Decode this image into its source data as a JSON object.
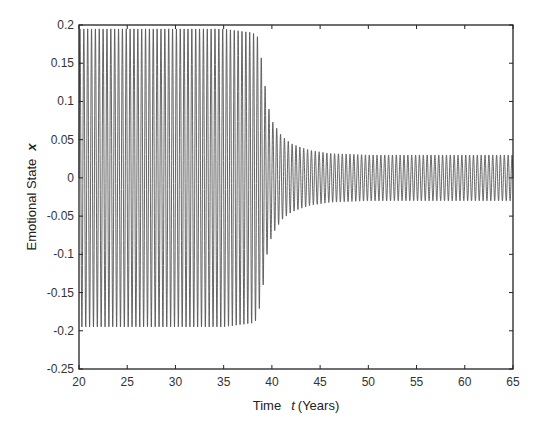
{
  "chart_data": {
    "type": "line",
    "title": "",
    "xlabel": "Time t (Years)",
    "xlabel_parts": {
      "prefix": "Time",
      "var": "t",
      "suffix": "(Years)"
    },
    "ylabel": "Emotional State x",
    "ylabel_parts": {
      "prefix": "Emotional State",
      "var": "x"
    },
    "xlim": [
      20,
      65
    ],
    "ylim": [
      -0.25,
      0.2
    ],
    "xticks": [
      20,
      25,
      30,
      35,
      40,
      45,
      50,
      55,
      60,
      65
    ],
    "yticks": [
      0.2,
      0.15,
      0.1,
      0.05,
      0,
      -0.05,
      -0.1,
      -0.15,
      -0.2,
      -0.25
    ],
    "ytick_labels": [
      "0.2",
      "0.15",
      "0.1",
      "0.05",
      "0",
      "-0.05",
      "-0.1",
      "-0.15",
      "-0.2",
      "-0.25"
    ],
    "grid": false,
    "legend": null,
    "series": [
      {
        "name": "x(t)",
        "color": "#555555",
        "description": "Dense oscillation: large-amplitude limit cycle (~±0.195) from t=20 to ~38.5, rapid collapse near t≈39-40, then small steady oscillation (~±0.03) from t≈46 to 65",
        "period_years": 0.4,
        "envelope": {
          "t": [
            20,
            25,
            30,
            35,
            38,
            38.5,
            39,
            39.5,
            40,
            41,
            42,
            43,
            44,
            46,
            50,
            55,
            60,
            65
          ],
          "amplitude": [
            0.195,
            0.195,
            0.195,
            0.195,
            0.19,
            0.185,
            0.15,
            0.1,
            0.075,
            0.055,
            0.045,
            0.04,
            0.036,
            0.032,
            0.03,
            0.03,
            0.03,
            0.03
          ]
        }
      }
    ]
  }
}
